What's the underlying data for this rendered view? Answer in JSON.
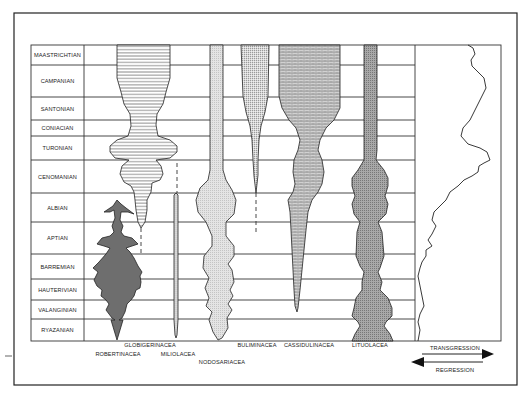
{
  "figure": {
    "type": "range-chart",
    "stages": [
      {
        "name": "MAASTRICHTIAN",
        "top": 45,
        "bottom": 65
      },
      {
        "name": "CAMPANIAN",
        "top": 65,
        "bottom": 97
      },
      {
        "name": "SANTONIAN",
        "top": 97,
        "bottom": 120
      },
      {
        "name": "CONIACIAN",
        "top": 120,
        "bottom": 136
      },
      {
        "name": "TURONIAN",
        "top": 136,
        "bottom": 160
      },
      {
        "name": "CENOMANIAN",
        "top": 160,
        "bottom": 193
      },
      {
        "name": "ALBIAN",
        "top": 193,
        "bottom": 222
      },
      {
        "name": "APTIAN",
        "top": 222,
        "bottom": 254
      },
      {
        "name": "BARREMIAN",
        "top": 254,
        "bottom": 279
      },
      {
        "name": "HAUTERIVIAN",
        "top": 279,
        "bottom": 300
      },
      {
        "name": "VALANGINIAN",
        "top": 300,
        "bottom": 319
      },
      {
        "name": "RYAZANIAN",
        "top": 319,
        "bottom": 341
      }
    ],
    "taxa": [
      {
        "name": "ROBERTINACEA",
        "label_x": 118,
        "label_y": 355,
        "fill": "dark-grey"
      },
      {
        "name": "GLOBIGERINACEA",
        "label_x": 150,
        "label_y": 346,
        "fill": "horizontal-lines"
      },
      {
        "name": "MILIOLACEA",
        "label_x": 178,
        "label_y": 355,
        "fill": "dots"
      },
      {
        "name": "NODOSARIACEA",
        "label_x": 222,
        "label_y": 363,
        "fill": "light-stipple"
      },
      {
        "name": "BULIMINACEA",
        "label_x": 257,
        "label_y": 346,
        "fill": "fine-stipple"
      },
      {
        "name": "CASSIDULINACEA",
        "label_x": 309,
        "label_y": 346,
        "fill": "brick"
      },
      {
        "name": "LITUOLACEA",
        "label_x": 370,
        "label_y": 346,
        "fill": "dark-stipple"
      }
    ],
    "sea_level": {
      "transgression_label": "TRANSGRESSION",
      "regression_label": "REGRESSION"
    }
  }
}
